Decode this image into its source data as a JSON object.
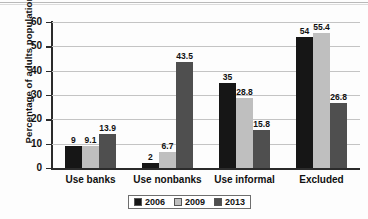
{
  "chart_data": {
    "type": "bar",
    "title": "",
    "xlabel": "",
    "ylabel": "Percentage of adults population",
    "categories": [
      "Use banks",
      "Use nonbanks",
      "Use informal",
      "Excluded"
    ],
    "series": [
      {
        "name": "2006",
        "color": "#161616",
        "values": [
          9,
          2,
          35,
          54
        ]
      },
      {
        "name": "2009",
        "color": "#bfbfbf",
        "values": [
          9.1,
          6.7,
          28.8,
          55.4
        ]
      },
      {
        "name": "2013",
        "color": "#4f4f4f",
        "values": [
          13.9,
          43.5,
          15.8,
          26.8
        ]
      }
    ],
    "value_labels": [
      [
        "9",
        "9.1",
        "13.9"
      ],
      [
        "2",
        "6.7",
        "43.5"
      ],
      [
        "35",
        "28.8",
        "15.8"
      ],
      [
        "54",
        "55.4",
        "26.8"
      ]
    ],
    "ylim": [
      0,
      60
    ],
    "yticks": [
      0,
      10,
      20,
      30,
      40,
      50,
      60
    ],
    "ytick_labels": [
      "0",
      "10",
      "20",
      "30",
      "40",
      "50",
      "60"
    ],
    "grid": true,
    "legend_position": "bottom-center"
  }
}
